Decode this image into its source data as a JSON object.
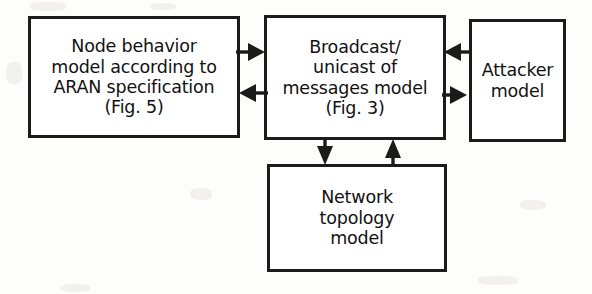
{
  "diagram": {
    "background_color": "#fdfdfc",
    "stroke_color": "#1b1b1b",
    "text_color": "#111111",
    "nodes": [
      {
        "id": "node-behavior",
        "label": "Node behavior\nmodel according to\nARAN specification\n(Fig. 5)",
        "x": 28,
        "y": 16,
        "width": 212,
        "height": 122
      },
      {
        "id": "broadcast",
        "label": "Broadcast/\nunicast of\nmessages model\n(Fig. 3)",
        "x": 264,
        "y": 15,
        "width": 182,
        "height": 125
      },
      {
        "id": "attacker",
        "label": "Attacker\nmodel",
        "x": 469,
        "y": 19,
        "width": 97,
        "height": 123
      },
      {
        "id": "network-topology",
        "label": "Network\ntopology\nmodel",
        "x": 267,
        "y": 164,
        "width": 180,
        "height": 108
      }
    ],
    "connectors": [
      {
        "id": "node-behavior-to-broadcast",
        "from": "node-behavior",
        "to": "broadcast",
        "direction": "right",
        "orientation": "horizontal"
      },
      {
        "id": "broadcast-to-node-behavior",
        "from": "broadcast",
        "to": "node-behavior",
        "direction": "left",
        "orientation": "horizontal"
      },
      {
        "id": "attacker-to-broadcast",
        "from": "attacker",
        "to": "broadcast",
        "direction": "left",
        "orientation": "horizontal"
      },
      {
        "id": "broadcast-to-attacker",
        "from": "broadcast",
        "to": "attacker",
        "direction": "right",
        "orientation": "horizontal"
      },
      {
        "id": "broadcast-to-network-topology",
        "from": "broadcast",
        "to": "network-topology",
        "direction": "down",
        "orientation": "vertical"
      },
      {
        "id": "network-topology-to-broadcast",
        "from": "network-topology",
        "to": "broadcast",
        "direction": "up",
        "orientation": "vertical"
      }
    ]
  }
}
